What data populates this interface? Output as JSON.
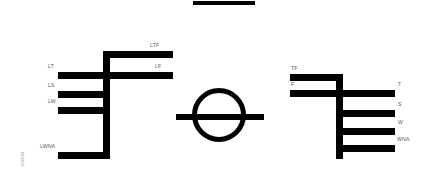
{
  "figure": {
    "title_bar": {
      "name": "top-rule",
      "x": 193,
      "y": 1,
      "width": 62,
      "height": 4
    },
    "side_code": "000004",
    "colors": {
      "ink": "#000000",
      "label_text": "#585858",
      "background": "#ffffff"
    },
    "left_tree": {
      "name": "left-cladogram",
      "trunk": {
        "x": 103,
        "y": 51,
        "width": 7,
        "height": 108
      },
      "branches": [
        {
          "label": "LTF",
          "x": 110,
          "y": 51,
          "width": 63,
          "height": 7,
          "label_x": 150,
          "label_y": 42
        },
        {
          "label": "LF",
          "x": 110,
          "y": 72,
          "width": 63,
          "height": 7,
          "label_x": 155,
          "label_y": 63
        },
        {
          "label": "LT",
          "x": 58,
          "y": 72,
          "width": 52,
          "height": 7,
          "label_x": 48,
          "label_y": 63
        },
        {
          "label": "LS",
          "x": 58,
          "y": 91,
          "width": 52,
          "height": 7,
          "label_x": 48,
          "label_y": 82
        },
        {
          "label": "LW",
          "x": 58,
          "y": 107,
          "width": 52,
          "height": 7,
          "label_x": 48,
          "label_y": 98
        },
        {
          "label": "LWNA",
          "x": 58,
          "y": 152,
          "width": 52,
          "height": 7,
          "label_x": 40,
          "label_y": 143
        }
      ]
    },
    "center_symbol": {
      "name": "circle-with-bar",
      "circle": {
        "x": 192,
        "y": 88,
        "size": 54,
        "stroke": 5
      },
      "crossbar": {
        "x": 176,
        "y": 114,
        "width": 88,
        "height": 6
      }
    },
    "right_tree": {
      "name": "right-cladogram",
      "trunk": {
        "x": 336,
        "y": 74,
        "width": 7,
        "height": 85
      },
      "branches": [
        {
          "label": "TF",
          "x": 290,
          "y": 74,
          "width": 53,
          "height": 7,
          "label_x": 291,
          "label_y": 65
        },
        {
          "label": "F",
          "x": 290,
          "y": 90,
          "width": 53,
          "height": 7,
          "label_x": 291,
          "label_y": 81
        },
        {
          "label": "T",
          "x": 343,
          "y": 90,
          "width": 52,
          "height": 7,
          "label_x": 398,
          "label_y": 81
        },
        {
          "label": "S",
          "x": 343,
          "y": 110,
          "width": 52,
          "height": 7,
          "label_x": 398,
          "label_y": 101
        },
        {
          "label": "W",
          "x": 343,
          "y": 128,
          "width": 52,
          "height": 7,
          "label_x": 398,
          "label_y": 119
        },
        {
          "label": "WNA",
          "x": 343,
          "y": 145,
          "width": 52,
          "height": 7,
          "label_x": 397,
          "label_y": 136
        }
      ]
    }
  }
}
